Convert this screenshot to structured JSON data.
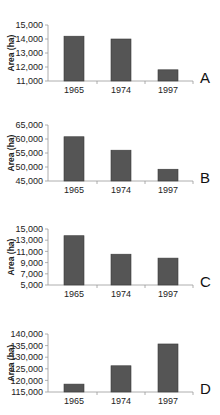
{
  "chart_data": [
    {
      "type": "bar",
      "panel_label": "A",
      "title": "",
      "xlabel": "",
      "ylabel": "Area (ha)",
      "categories": [
        "1965",
        "1974",
        "1997"
      ],
      "values": [
        14200,
        14000,
        11800
      ],
      "ylim": [
        11000,
        15000
      ],
      "yticks": [
        11000,
        12000,
        13000,
        14000,
        15000
      ],
      "ytick_labels": [
        "11,000",
        "12,000",
        "13,000",
        "14,000",
        "15,000"
      ],
      "grid": false,
      "bar_color": "#555555"
    },
    {
      "type": "bar",
      "panel_label": "B",
      "title": "",
      "xlabel": "",
      "ylabel": "Area (ha)",
      "categories": [
        "1965",
        "1974",
        "1997"
      ],
      "values": [
        60800,
        56000,
        49200
      ],
      "ylim": [
        45000,
        65000
      ],
      "yticks": [
        45000,
        50000,
        55000,
        60000,
        65000
      ],
      "ytick_labels": [
        "45,000",
        "50,000",
        "55,000",
        "60,000",
        "65,000"
      ],
      "grid": false,
      "bar_color": "#555555"
    },
    {
      "type": "bar",
      "panel_label": "C",
      "title": "",
      "xlabel": "",
      "ylabel": "Area (ha)",
      "categories": [
        "1965",
        "1974",
        "1997"
      ],
      "values": [
        13800,
        10500,
        9800
      ],
      "ylim": [
        5000,
        15000
      ],
      "yticks": [
        5000,
        7000,
        9000,
        11000,
        13000,
        15000
      ],
      "ytick_labels": [
        "5,000",
        "7,000",
        "9,000",
        "11,000",
        "13,000",
        "15,000"
      ],
      "grid": false,
      "bar_color": "#555555"
    },
    {
      "type": "bar",
      "panel_label": "D",
      "title": "",
      "xlabel": "",
      "ylabel": "Area (ha)",
      "categories": [
        "1965",
        "1974",
        "1997"
      ],
      "values": [
        118400,
        126300,
        135700
      ],
      "ylim": [
        115000,
        140000
      ],
      "yticks": [
        115000,
        120000,
        125000,
        130000,
        135000,
        140000
      ],
      "ytick_labels": [
        "115,000",
        "120,000",
        "125,000",
        "130,000",
        "135,000",
        "140,000"
      ],
      "grid": false,
      "bar_color": "#555555"
    }
  ]
}
